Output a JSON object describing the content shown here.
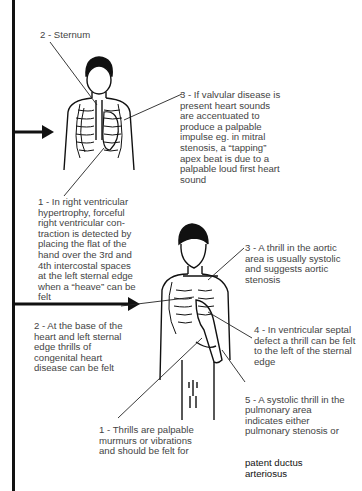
{
  "figure_1": {
    "labels": {
      "sternum": "2 - Sternum",
      "valvular": "3 - If valvular disease is\npresent heart sounds\nare accentuated to\nproduce a palpable\nimpulse eg. in mitral\nstenosis, a “tapping”\napex beat is due to a\npalpable loud first heart\nsound",
      "rv_hypertrophy": "1 - In right ventricular\nhypertrophy, forceful\nright ventricular con-\ntraction is detected by\nplacing the flat of the\nhand over the 3rd and\n4th intercostal spaces\nat the left sternal edge\nwhen a “heave” can be\nfelt"
    }
  },
  "figure_2": {
    "labels": {
      "aortic_thrill": "3 - A thrill in the aortic\narea is usually systolic\nand suggests aortic\nstenosis",
      "base_thrills": "2 - At the base of the\nheart and left sternal\nedge thrills of\ncongenital heart\ndisease can be felt",
      "vsd_thrill": "4 - In ventricular septal\ndefect a thrill can be felt\nto the left of the sternal\nedge",
      "pulmonary_thrill_a": "5 - A systolic thrill in the\npulmonary area\nindicates either\npulmonary stenosis or",
      "pulmonary_thrill_b": "patent ductus\narteriosus",
      "thrills_definition": "1 - Thrills are palpable\nmurmurs or vibrations\nand should be felt for"
    }
  },
  "icons": [
    "arrow-right-icon",
    "arrow-right-icon"
  ]
}
